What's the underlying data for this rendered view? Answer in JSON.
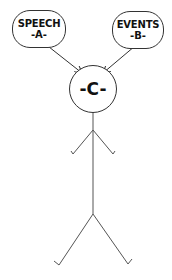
{
  "diagram": {
    "nodes": [
      {
        "id": "A",
        "label": "SPEECH",
        "tag": "-A-"
      },
      {
        "id": "B",
        "label": "EVENTS",
        "tag": "-B-"
      },
      {
        "id": "C",
        "label": "-C-"
      }
    ],
    "edges": [
      {
        "from": "A",
        "to": "C"
      },
      {
        "from": "B",
        "to": "C"
      }
    ],
    "figure": "stick-figure",
    "colors": {
      "stroke": "#333333",
      "text": "#111111",
      "background": "#ffffff"
    }
  }
}
